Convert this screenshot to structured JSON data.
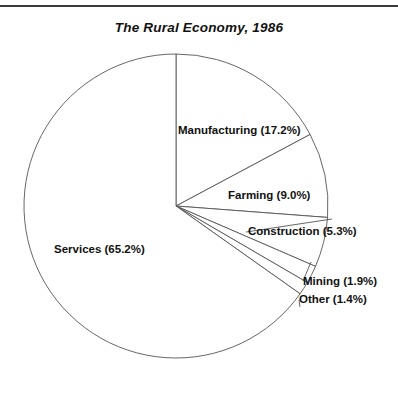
{
  "figure": {
    "title": "The Rural Economy, 1986",
    "top_rule": true,
    "background_color": "#ffffff",
    "line_color": "#555555",
    "text_color": "#111111"
  },
  "labels": {
    "manufacturing": "Manufacturing (17.2%)",
    "farming": "Farming (9.0%)",
    "construction": "Construction (5.3%)",
    "mining": "Mining (1.9%)",
    "other": "Other (1.4%)",
    "services": "Services (65.2%)"
  },
  "chart_data": {
    "type": "pie",
    "title": "The Rural Economy, 1986",
    "xlabel": "",
    "ylabel": "",
    "units": "percent",
    "total": 100.0,
    "start_angle_deg": 90,
    "direction": "clockwise",
    "legend": "none",
    "grid": false,
    "labels_position": "inside-and-outside-with-leader-lines",
    "categories": [
      "Manufacturing",
      "Farming",
      "Construction",
      "Mining",
      "Other",
      "Services"
    ],
    "values": [
      17.2,
      9.0,
      5.3,
      1.9,
      1.4,
      65.2
    ],
    "slices": [
      {
        "name": "Manufacturing",
        "value": 17.2,
        "label": "Manufacturing (17.2%)",
        "sweep_deg": 61.92,
        "fill": "#ffffff"
      },
      {
        "name": "Farming",
        "value": 9.0,
        "label": "Farming (9.0%)",
        "sweep_deg": 32.4,
        "fill": "#ffffff"
      },
      {
        "name": "Construction",
        "value": 5.3,
        "label": "Construction (5.3%)",
        "sweep_deg": 19.08,
        "fill": "#ffffff"
      },
      {
        "name": "Mining",
        "value": 1.9,
        "label": "Mining (1.9%)",
        "sweep_deg": 6.84,
        "fill": "#ffffff"
      },
      {
        "name": "Other",
        "value": 1.4,
        "label": "Other (1.4%)",
        "sweep_deg": 5.04,
        "fill": "#ffffff"
      },
      {
        "name": "Services",
        "value": 65.2,
        "label": "Services (65.2%)",
        "sweep_deg": 234.72,
        "fill": "#ffffff"
      }
    ]
  },
  "geometry": {
    "center_x": 176,
    "center_y": 206,
    "radius": 152
  }
}
